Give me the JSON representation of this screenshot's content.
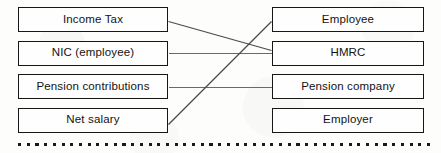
{
  "diagram": {
    "type": "flow-mapping",
    "background_color": "#fdfdfb",
    "border_color": "#161616",
    "connector_color": "#5c5c5c",
    "left_column": {
      "name": "payment-items",
      "nodes": [
        {
          "id": "income-tax",
          "label": "Income Tax"
        },
        {
          "id": "nic-employee",
          "label": "NIC (employee)"
        },
        {
          "id": "pension-contributions",
          "label": "Pension contributions"
        },
        {
          "id": "net-salary",
          "label": "Net salary"
        }
      ]
    },
    "right_column": {
      "name": "recipients",
      "nodes": [
        {
          "id": "employee",
          "label": "Employee"
        },
        {
          "id": "hmrc",
          "label": "HMRC"
        },
        {
          "id": "pension-company",
          "label": "Pension company"
        },
        {
          "id": "employer",
          "label": "Employer"
        }
      ]
    },
    "connections": [
      {
        "from": "income-tax",
        "to": "hmrc",
        "style": "diagonal-down"
      },
      {
        "from": "nic-employee",
        "to": "hmrc",
        "style": "horizontal"
      },
      {
        "from": "pension-contributions",
        "to": "pension-company",
        "style": "horizontal"
      },
      {
        "from": "net-salary",
        "to": "employee",
        "style": "diagonal-up"
      }
    ],
    "footer_rule": {
      "name": "dotted-divider",
      "style": "square-dots"
    }
  }
}
